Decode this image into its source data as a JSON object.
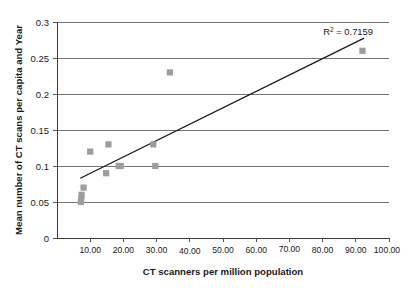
{
  "chart_data": {
    "type": "scatter",
    "title": "",
    "xlabel": "CT scanners per million population",
    "ylabel": "Mean number of CT scans per capita and Year",
    "xlim": [
      0,
      100
    ],
    "ylim": [
      0,
      0.3
    ],
    "grid": true,
    "legend": null,
    "x_ticks": [
      10,
      20,
      30,
      40,
      50,
      60,
      70,
      80,
      90,
      100
    ],
    "x_tick_labels": [
      "10.00",
      "20.00",
      "30.00",
      "40.00",
      "50.00",
      "60.00",
      "70.00",
      "80.00",
      "90.00",
      "100.00"
    ],
    "y_ticks": [
      0,
      0.05,
      0.1,
      0.15,
      0.2,
      0.25,
      0.3
    ],
    "y_tick_labels": [
      "0",
      "0.05",
      "0.1",
      "0.15",
      "0.2",
      "0.25",
      "0.3"
    ],
    "marker_color": "#9d9d9d",
    "marker_shape": "square",
    "points": [
      {
        "x": 7.2,
        "y": 0.05
      },
      {
        "x": 7.3,
        "y": 0.055
      },
      {
        "x": 7.4,
        "y": 0.06
      },
      {
        "x": 8.0,
        "y": 0.07
      },
      {
        "x": 10.0,
        "y": 0.12
      },
      {
        "x": 14.8,
        "y": 0.09
      },
      {
        "x": 15.5,
        "y": 0.13
      },
      {
        "x": 18.6,
        "y": 0.1
      },
      {
        "x": 19.2,
        "y": 0.1
      },
      {
        "x": 29.0,
        "y": 0.13
      },
      {
        "x": 29.6,
        "y": 0.1
      },
      {
        "x": 34.0,
        "y": 0.23
      },
      {
        "x": 92.0,
        "y": 0.26
      }
    ],
    "trendline": {
      "x0": 7.0,
      "y0": 0.083,
      "x1": 92.5,
      "y1": 0.2775,
      "color": "#1a1a1a"
    },
    "annotations": [
      {
        "name": "r-squared",
        "text_prefix": "R",
        "text_sup": "2",
        "text_suffix": " = 0.7159",
        "value": 0.7159
      }
    ]
  }
}
